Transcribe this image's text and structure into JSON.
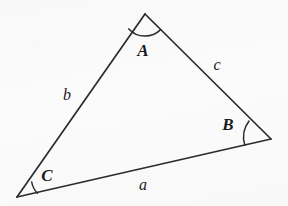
{
  "figure": {
    "name": "labeled-triangle",
    "background_color": "#fbfbfb",
    "stroke_color": "#2b2b2b",
    "width": 288,
    "height": 206
  },
  "vertices": [
    {
      "id": "A",
      "label": "A",
      "x": 145,
      "y": 14,
      "label_x": 143,
      "label_y": 50,
      "arc_radius": 22
    },
    {
      "id": "B",
      "label": "B",
      "x": 271,
      "y": 139,
      "label_x": 228,
      "label_y": 124,
      "arc_radius": 27
    },
    {
      "id": "C",
      "label": "C",
      "x": 17,
      "y": 197,
      "label_x": 47,
      "label_y": 175,
      "arc_radius": 21
    }
  ],
  "sides": [
    {
      "id": "a",
      "label": "a",
      "from": "C",
      "to": "B",
      "label_x": 143,
      "label_y": 185
    },
    {
      "id": "b",
      "label": "b",
      "from": "C",
      "to": "A",
      "label_x": 67,
      "label_y": 95
    },
    {
      "id": "c",
      "label": "c",
      "from": "A",
      "to": "B",
      "label_x": 217,
      "label_y": 65
    }
  ],
  "paths": {
    "side_a": "M 17 197 L 271 139",
    "side_b": "M 17 197 L 145 14",
    "side_c": "M 145 14 L 271 139",
    "arc_A": "M 128.8 28.9 A 22 22 0 0 0 160.6 29.6",
    "arc_B": "M 249.0 121.0 A 27 27 0 0 0 244.8 145.1",
    "arc_C": "M 31.7 182.0 A 21 21 0 0 0 37.5 193.3"
  }
}
